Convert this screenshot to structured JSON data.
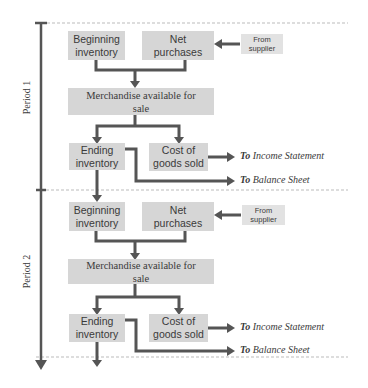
{
  "colors": {
    "box_fill": "#d6d6d6",
    "arrow": "#555555",
    "text": "#3a3a3a",
    "dashed_line": "#aaaaaa"
  },
  "periods": [
    {
      "label": "Period 1",
      "beginning_inventory": "Beginning inventory",
      "net_purchases": "Net purchases",
      "from_supplier": "From supplier",
      "merchandise": "Merchandise available for sale",
      "ending_inventory": "Ending inventory",
      "cost_of_goods_sold": "Cost of goods sold",
      "to_income_statement": {
        "prefix": "To",
        "target": "Income Statement"
      },
      "to_balance_sheet": {
        "prefix": "To",
        "target": "Balance Sheet"
      }
    },
    {
      "label": "Period 2",
      "beginning_inventory": "Beginning inventory",
      "net_purchases": "Net purchases",
      "from_supplier": "From supplier",
      "merchandise": "Merchandise available for sale",
      "ending_inventory": "Ending inventory",
      "cost_of_goods_sold": "Cost of goods sold",
      "to_income_statement": {
        "prefix": "To",
        "target": "Income Statement"
      },
      "to_balance_sheet": {
        "prefix": "To",
        "target": "Balance Sheet"
      }
    }
  ]
}
